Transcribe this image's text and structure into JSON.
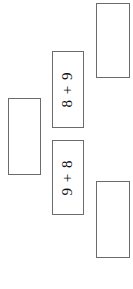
{
  "page": {
    "background_color": "#ffffff",
    "border_color": "#6b6b6b",
    "text_color": "#111111",
    "width": 133,
    "height": 289
  },
  "cards": [
    {
      "name": "empty-card-top-right",
      "text": "",
      "empty": true,
      "x": 96,
      "y": 3,
      "width": 34,
      "height": 75
    },
    {
      "name": "expression-card-8-plus-9",
      "text": "8 + 9",
      "empty": false,
      "x": 52,
      "y": 51,
      "width": 32,
      "height": 77
    },
    {
      "name": "empty-card-left",
      "text": "",
      "empty": true,
      "x": 8,
      "y": 98,
      "width": 33,
      "height": 77
    },
    {
      "name": "expression-card-9-plus-8",
      "text": "9 + 8",
      "empty": false,
      "x": 52,
      "y": 140,
      "width": 32,
      "height": 75
    },
    {
      "name": "empty-card-bottom-right",
      "text": "",
      "empty": true,
      "x": 96,
      "y": 181,
      "width": 34,
      "height": 77
    }
  ]
}
